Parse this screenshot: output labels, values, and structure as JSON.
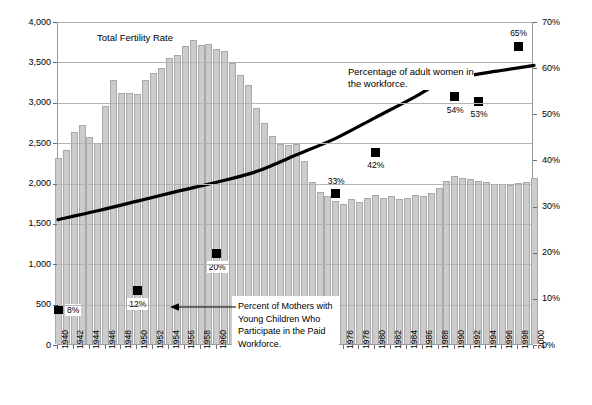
{
  "chart_data": {
    "type": "bar",
    "title": "",
    "xlabel": "",
    "ylabel": "",
    "grid": true,
    "legend_position": "inline-annotations",
    "x_ticks": [
      "1940",
      "1942",
      "1944",
      "1946",
      "1948",
      "1950",
      "1952",
      "1954",
      "1956",
      "1958",
      "1960",
      "1962",
      "1964",
      "1966",
      "1968",
      "1970",
      "1972",
      "1974",
      "1976",
      "1978",
      "1980",
      "1982",
      "1984",
      "1986",
      "1988",
      "1990",
      "1992",
      "1994",
      "1996",
      "1998",
      "2000"
    ],
    "x_range": [
      1940,
      2000
    ],
    "left_axis": {
      "label": "",
      "ticks": [
        "0",
        "500",
        "1,000",
        "1,500",
        "2,000",
        "2,500",
        "3,000",
        "3,500",
        "4,000"
      ],
      "values": [
        0,
        500,
        1000,
        1500,
        2000,
        2500,
        3000,
        3500,
        4000
      ],
      "ylim": [
        0,
        4000
      ]
    },
    "right_axis": {
      "label": "",
      "ticks": [
        "0%",
        "10%",
        "20%",
        "30%",
        "40%",
        "50%",
        "60%",
        "70%"
      ],
      "values": [
        0,
        10,
        20,
        30,
        40,
        50,
        60,
        70
      ],
      "ylim": [
        0,
        70
      ]
    },
    "series": [
      {
        "name": "Total Fertility Rate",
        "type": "bar",
        "axis": "left",
        "color": "#cccccc",
        "years": [
          1940,
          1941,
          1942,
          1943,
          1944,
          1945,
          1946,
          1947,
          1948,
          1949,
          1950,
          1951,
          1952,
          1953,
          1954,
          1955,
          1956,
          1957,
          1958,
          1959,
          1960,
          1961,
          1962,
          1963,
          1964,
          1965,
          1966,
          1967,
          1968,
          1969,
          1970,
          1971,
          1972,
          1973,
          1974,
          1975,
          1976,
          1977,
          1978,
          1979,
          1980,
          1981,
          1982,
          1983,
          1984,
          1985,
          1986,
          1987,
          1988,
          1989,
          1990,
          1991,
          1992,
          1993,
          1994,
          1995,
          1996,
          1997,
          1998,
          1999,
          2000
        ],
        "values": [
          2301,
          2399,
          2628,
          2718,
          2568,
          2491,
          2943,
          3274,
          3109,
          3110,
          3091,
          3269,
          3358,
          3424,
          3543,
          3580,
          3689,
          3767,
          3701,
          3712,
          3654,
          3629,
          3474,
          3333,
          3208,
          2928,
          2736,
          2573,
          2477,
          2465,
          2480,
          2267,
          2010,
          1879,
          1835,
          1774,
          1738,
          1790,
          1760,
          1808,
          1840,
          1812,
          1828,
          1799,
          1806,
          1844,
          1837,
          1872,
          1934,
          2014,
          2081,
          2062,
          2046,
          2020,
          2002,
          1978,
          1976,
          1971,
          1999,
          2008,
          2056
        ]
      },
      {
        "name": "Percentage of adult women in the workforce.",
        "type": "line",
        "axis": "right",
        "color": "#000000",
        "years": [
          1940,
          1945,
          1950,
          1955,
          1960,
          1965,
          1970,
          1975,
          1980,
          1985,
          1988,
          1990,
          1995,
          2000
        ],
        "values": [
          27.4,
          29.3,
          31.4,
          33.5,
          35.5,
          37.8,
          41.4,
          45.0,
          49.5,
          54.0,
          57.0,
          58.0,
          59.5,
          60.8
        ]
      },
      {
        "name": "Percent of Mothers with Young Children Who Participate in the Paid Workforce.",
        "type": "scatter",
        "axis": "right",
        "color": "#000000",
        "points": [
          {
            "year": 1940,
            "value": 8,
            "label": "8%",
            "label_pos": "right"
          },
          {
            "year": 1950,
            "value": 12,
            "label": "12%",
            "label_pos": "below"
          },
          {
            "year": 1960,
            "value": 20,
            "label": "20%",
            "label_pos": "below"
          },
          {
            "year": 1975,
            "value": 33,
            "label": "33%",
            "label_pos": "above"
          },
          {
            "year": 1980,
            "value": 42,
            "label": "42%",
            "label_pos": "below"
          },
          {
            "year": 1990,
            "value": 54,
            "label": "54%",
            "label_pos": "below"
          },
          {
            "year": 1993,
            "value": 53,
            "label": "53%",
            "label_pos": "below"
          },
          {
            "year": 1998,
            "value": 65,
            "label": "65%",
            "label_pos": "above"
          }
        ]
      }
    ],
    "annotations": [
      {
        "id": "fertility",
        "text": "Total Fertility Rate"
      },
      {
        "id": "workforce",
        "line1": "Percentage of adult women in",
        "line2": "the workforce."
      },
      {
        "id": "mothers",
        "line1": "Percent of Mothers with",
        "line2": "Young Children Who",
        "line3": "Participate in the Paid",
        "line4": "Workforce."
      }
    ]
  }
}
